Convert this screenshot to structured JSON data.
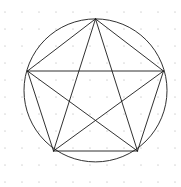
{
  "figure": {
    "canvas": {
      "width": 181,
      "height": 187,
      "background_color": "#ffffff"
    },
    "grid": {
      "name": "dot-grid",
      "visible": true,
      "spacing": 17,
      "origin_x": 5,
      "origin_y": 12,
      "dot_radius": 0.85,
      "color": "#d8d8d8"
    },
    "circle": {
      "label": "circumscribed circle",
      "center_x": 95.5,
      "center_y": 90.4,
      "radius": 71.5,
      "stroke_color": "#1a1a1a",
      "stroke_width": 0.9,
      "fill": "none"
    },
    "vertices": [
      {
        "label": "A",
        "position": "top",
        "x": 95.5,
        "y": 18.9
      },
      {
        "label": "B",
        "position": "upper-right",
        "x": 163.5,
        "y": 71.0
      },
      {
        "label": "C",
        "position": "lower-right",
        "x": 137.5,
        "y": 151.0
      },
      {
        "label": "D",
        "position": "lower-left",
        "x": 53.5,
        "y": 151.0
      },
      {
        "label": "E",
        "position": "upper-left",
        "x": 27.5,
        "y": 71.0
      }
    ],
    "pentagon": {
      "label": "regular pentagon",
      "edges": [
        [
          "A",
          "B"
        ],
        [
          "B",
          "C"
        ],
        [
          "C",
          "D"
        ],
        [
          "D",
          "E"
        ],
        [
          "E",
          "A"
        ]
      ],
      "stroke_color": "#1a1a1a",
      "stroke_width": 0.9,
      "fill": "none"
    },
    "pentagram": {
      "label": "pentagram star diagonals",
      "edges": [
        [
          "A",
          "C"
        ],
        [
          "C",
          "E"
        ],
        [
          "E",
          "B"
        ],
        [
          "B",
          "D"
        ],
        [
          "D",
          "A"
        ]
      ],
      "stroke_color": "#1a1a1a",
      "stroke_width": 0.9,
      "fill": "none"
    }
  }
}
